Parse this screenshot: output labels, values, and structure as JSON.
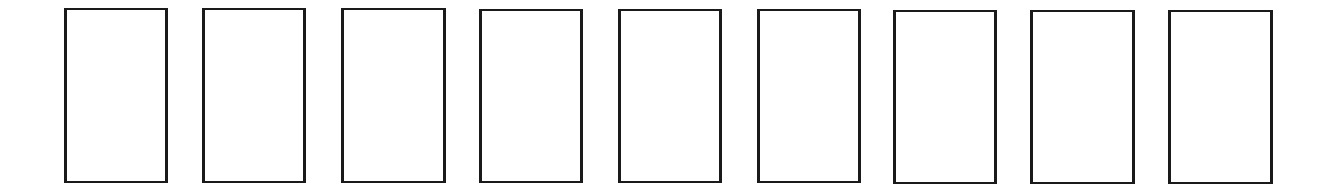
{
  "diagram": {
    "border_color": "#1a1a1a",
    "background_color": "#ffffff",
    "boxes": [
      {
        "index": 1,
        "label": "",
        "x": 64,
        "y": 8,
        "w": 104,
        "h": 175
      },
      {
        "index": 2,
        "label": "",
        "x": 202,
        "y": 8,
        "w": 104,
        "h": 175
      },
      {
        "index": 3,
        "label": "",
        "x": 341,
        "y": 8,
        "w": 105,
        "h": 175
      },
      {
        "index": 4,
        "label": "",
        "x": 479,
        "y": 9,
        "w": 104,
        "h": 174
      },
      {
        "index": 5,
        "label": "",
        "x": 618,
        "y": 9,
        "w": 104,
        "h": 174
      },
      {
        "index": 6,
        "label": "",
        "x": 757,
        "y": 9,
        "w": 104,
        "h": 174
      },
      {
        "index": 7,
        "label": "",
        "x": 893,
        "y": 10,
        "w": 104,
        "h": 174
      },
      {
        "index": 8,
        "label": "",
        "x": 1030,
        "y": 10,
        "w": 105,
        "h": 174
      },
      {
        "index": 9,
        "label": "",
        "x": 1168,
        "y": 10,
        "w": 105,
        "h": 174
      }
    ]
  }
}
